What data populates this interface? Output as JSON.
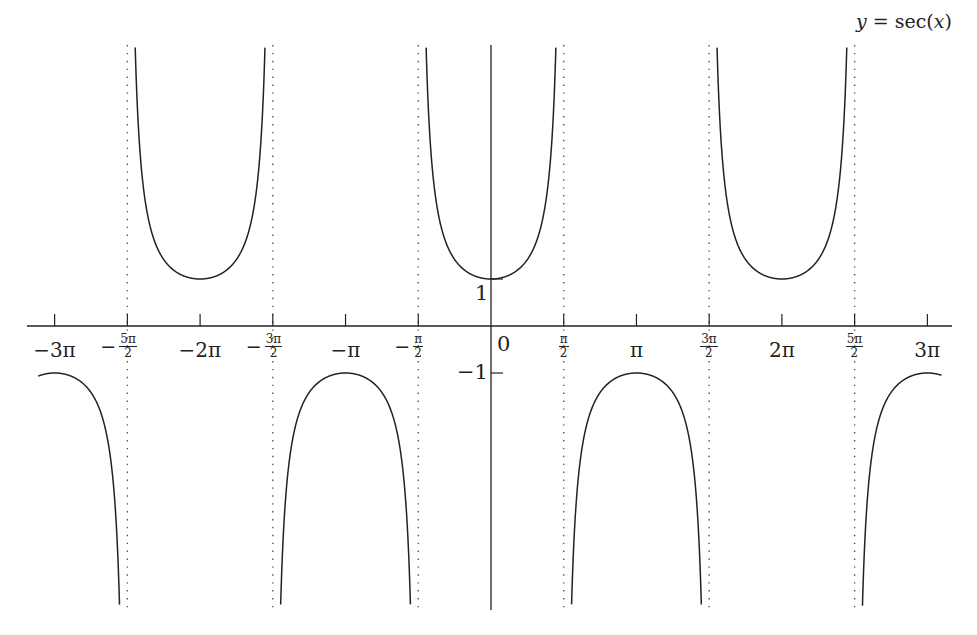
{
  "chart_data": {
    "type": "line",
    "title": "y = sec(x)",
    "title_parts": {
      "lhs": "y",
      "eq": " = ",
      "fn": "sec(",
      "var": "x",
      "close": ")"
    },
    "xlabel": "",
    "ylabel": "",
    "function": "sec(x)",
    "xlim": [
      -9.78,
      9.73
    ],
    "ylim": [
      -6,
      6
    ],
    "grid": false,
    "legend": "none",
    "x_ticks": [
      {
        "value": -9.4248,
        "label": "−3π",
        "type": "plain"
      },
      {
        "value": -7.854,
        "label": "−5π/2",
        "type": "frac",
        "sign": "−",
        "num": "5π",
        "den": "2"
      },
      {
        "value": -6.2832,
        "label": "−2π",
        "type": "plain"
      },
      {
        "value": -4.7124,
        "label": "−3π/2",
        "type": "frac",
        "sign": "−",
        "num": "3π",
        "den": "2"
      },
      {
        "value": -3.1416,
        "label": "−π",
        "type": "plain"
      },
      {
        "value": -1.5708,
        "label": "−π/2",
        "type": "frac",
        "sign": "−",
        "num": "π",
        "den": "2"
      },
      {
        "value": 0,
        "label": "0",
        "type": "zero"
      },
      {
        "value": 1.5708,
        "label": "π/2",
        "type": "frac",
        "sign": "",
        "num": "π",
        "den": "2"
      },
      {
        "value": 3.1416,
        "label": "π",
        "type": "plain"
      },
      {
        "value": 4.7124,
        "label": "3π/2",
        "type": "frac",
        "sign": "",
        "num": "3π",
        "den": "2"
      },
      {
        "value": 6.2832,
        "label": "2π",
        "type": "plain"
      },
      {
        "value": 7.854,
        "label": "5π/2",
        "type": "frac",
        "sign": "",
        "num": "5π",
        "den": "2"
      },
      {
        "value": 9.4248,
        "label": "3π",
        "type": "plain"
      }
    ],
    "y_ticks": [
      {
        "value": 1,
        "label": "1"
      },
      {
        "value": -1,
        "label": "−1"
      }
    ],
    "asymptotes": [
      -7.854,
      -4.7124,
      -1.5708,
      1.5708,
      4.7124,
      7.854
    ],
    "series": [
      {
        "name": "sec(x)",
        "color": "#222222",
        "branches": [
          {
            "x_range": [
              -9.78,
              -7.854
            ],
            "direction": "down",
            "extremum": {
              "x": -9.4248,
              "y": -1
            }
          },
          {
            "x_range": [
              -7.854,
              -4.7124
            ],
            "direction": "up",
            "extremum": {
              "x": -6.2832,
              "y": 1
            }
          },
          {
            "x_range": [
              -4.7124,
              -1.5708
            ],
            "direction": "down",
            "extremum": {
              "x": -3.1416,
              "y": -1
            }
          },
          {
            "x_range": [
              -1.5708,
              1.5708
            ],
            "direction": "up",
            "extremum": {
              "x": 0,
              "y": 1
            }
          },
          {
            "x_range": [
              1.5708,
              4.7124
            ],
            "direction": "down",
            "extremum": {
              "x": 3.1416,
              "y": -1
            }
          },
          {
            "x_range": [
              4.7124,
              7.854
            ],
            "direction": "up",
            "extremum": {
              "x": 6.2832,
              "y": 1
            }
          },
          {
            "x_range": [
              7.854,
              9.73
            ],
            "direction": "down",
            "extremum": {
              "x": 9.4248,
              "y": -1
            }
          }
        ]
      }
    ],
    "colors": {
      "curve": "#222222",
      "axis": "#222222",
      "asymptote": "#555555"
    }
  },
  "layout": {
    "origin_px": [
      491,
      326
    ],
    "px_per_unit_x": 46.3,
    "px_per_unit_y": 47,
    "x_axis_px": [
      27,
      952
    ],
    "y_axis_px": [
      45,
      610
    ]
  }
}
